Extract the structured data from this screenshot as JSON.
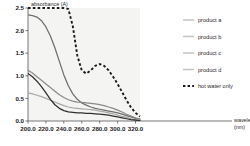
{
  "chart_data": {
    "type": "line",
    "title": "",
    "xlabel": "wavelength",
    "xlabel_unit": "(nm)",
    "ylabel": "absorbance (A)",
    "xlim": [
      200.0,
      325.0
    ],
    "ylim": [
      0.0,
      2.5
    ],
    "grid": false,
    "legend_position": "right",
    "xticks": [
      "200.0",
      "220.0",
      "240.0",
      "260.0",
      "280.0",
      "300.0",
      "320.0"
    ],
    "xtick_values": [
      200,
      220,
      240,
      260,
      280,
      300,
      320
    ],
    "yticks": [
      "0.0",
      "0.5",
      "1.0",
      "1.5",
      "2.0",
      "2.5"
    ],
    "ytick_values": [
      0.0,
      0.5,
      1.0,
      1.5,
      2.0,
      2.5
    ],
    "x": [
      200,
      205,
      210,
      215,
      220,
      225,
      230,
      235,
      240,
      245,
      250,
      255,
      260,
      265,
      270,
      275,
      280,
      285,
      290,
      295,
      300,
      305,
      310,
      315,
      320,
      325
    ],
    "series": [
      {
        "name": "product a",
        "style": "solid",
        "color": "#6e6e6e",
        "values": [
          2.35,
          2.33,
          2.3,
          2.22,
          2.08,
          1.88,
          1.62,
          1.32,
          1.02,
          0.78,
          0.6,
          0.48,
          0.4,
          0.35,
          0.31,
          0.28,
          0.26,
          0.24,
          0.22,
          0.2,
          0.18,
          0.15,
          0.12,
          0.09,
          0.06,
          0.04
        ]
      },
      {
        "name": "product b",
        "style": "solid",
        "color": "#8a8a8a",
        "values": [
          1.12,
          1.06,
          0.98,
          0.9,
          0.82,
          0.74,
          0.66,
          0.58,
          0.52,
          0.47,
          0.44,
          0.42,
          0.41,
          0.4,
          0.39,
          0.38,
          0.36,
          0.34,
          0.31,
          0.28,
          0.24,
          0.2,
          0.15,
          0.11,
          0.07,
          0.04
        ]
      },
      {
        "name": "product c",
        "style": "solid",
        "color": "#a9a9a9",
        "values": [
          0.62,
          0.6,
          0.57,
          0.54,
          0.5,
          0.46,
          0.42,
          0.38,
          0.34,
          0.31,
          0.29,
          0.28,
          0.27,
          0.26,
          0.25,
          0.24,
          0.22,
          0.2,
          0.18,
          0.16,
          0.13,
          0.1,
          0.08,
          0.05,
          0.03,
          0.02
        ]
      },
      {
        "name": "product d",
        "style": "solid",
        "color": "#2f2f2f",
        "values": [
          1.05,
          0.98,
          0.88,
          0.76,
          0.62,
          0.48,
          0.36,
          0.28,
          0.23,
          0.2,
          0.19,
          0.18,
          0.18,
          0.17,
          0.17,
          0.16,
          0.15,
          0.14,
          0.13,
          0.11,
          0.09,
          0.07,
          0.05,
          0.03,
          0.02,
          0.01
        ]
      },
      {
        "name": "hot water only",
        "style": "dotted",
        "color": "#1a1a1a",
        "values": [
          2.5,
          2.5,
          2.5,
          2.5,
          2.5,
          2.5,
          2.5,
          2.5,
          2.5,
          2.48,
          2.1,
          1.45,
          1.12,
          1.05,
          1.12,
          1.22,
          1.26,
          1.22,
          1.12,
          0.98,
          0.82,
          0.64,
          0.46,
          0.3,
          0.18,
          0.1
        ]
      }
    ]
  },
  "legend": {
    "entries": [
      {
        "label": "product a"
      },
      {
        "label": "product b"
      },
      {
        "label": "product c"
      },
      {
        "label": "product d"
      },
      {
        "label": "hot water only"
      }
    ]
  }
}
